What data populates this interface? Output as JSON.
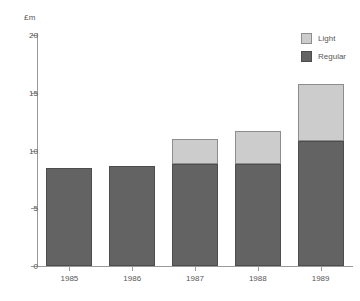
{
  "chart_data": {
    "type": "bar",
    "subtype": "stacked",
    "title": "",
    "xlabel": "",
    "ylabel": "£m",
    "categories": [
      "1985",
      "1986",
      "1987",
      "1988",
      "1989"
    ],
    "series": [
      {
        "name": "Regular",
        "color": "#636363",
        "values": [
          8.5,
          8.7,
          8.8,
          8.8,
          10.8
        ]
      },
      {
        "name": "Light",
        "color": "#cccccc",
        "values": [
          0,
          0,
          2.2,
          2.9,
          5.0
        ]
      }
    ],
    "totals": [
      8.5,
      8.7,
      11.0,
      11.7,
      15.8
    ],
    "ylim": [
      0,
      20
    ],
    "yticks": [
      0,
      5,
      10,
      15,
      20
    ],
    "ytick_labels": [
      "0",
      "5",
      "10",
      "15",
      "20"
    ],
    "grid": false,
    "legend_position": "top-right"
  },
  "axis": {
    "unit_label": "£m",
    "y_ticks": [
      {
        "value": 20,
        "label": "20"
      },
      {
        "value": 15,
        "label": "15"
      },
      {
        "value": 10,
        "label": "10"
      },
      {
        "value": 5,
        "label": "5"
      },
      {
        "value": 0,
        "label": "0"
      }
    ],
    "x_ticks": [
      {
        "label": "1985"
      },
      {
        "label": "1986"
      },
      {
        "label": "1987"
      },
      {
        "label": "1988"
      },
      {
        "label": "1989"
      }
    ]
  },
  "legend": {
    "items": [
      {
        "label": "Light",
        "color": "#cccccc"
      },
      {
        "label": "Regular",
        "color": "#636363"
      }
    ]
  }
}
